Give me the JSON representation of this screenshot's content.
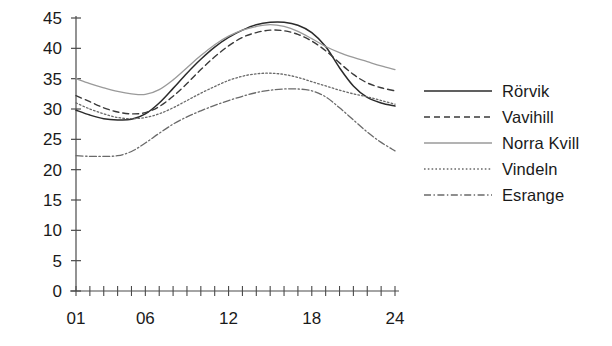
{
  "chart_data": {
    "type": "line",
    "title": "",
    "xlabel": "",
    "ylabel": "",
    "xlim": [
      1,
      24
    ],
    "ylim": [
      0,
      45
    ],
    "grid": false,
    "legend_position": "right",
    "x": [
      1,
      2,
      3,
      4,
      5,
      6,
      7,
      8,
      9,
      10,
      11,
      12,
      13,
      14,
      15,
      16,
      17,
      18,
      19,
      20,
      21,
      22,
      23,
      24
    ],
    "xtick_values": [
      1,
      6,
      12,
      18,
      24
    ],
    "xtick_labels": [
      "01",
      "06",
      "12",
      "18",
      "24"
    ],
    "ytick_values": [
      0,
      5,
      10,
      15,
      20,
      25,
      30,
      35,
      40,
      45
    ],
    "ytick_labels": [
      "0",
      "5",
      "10",
      "15",
      "20",
      "25",
      "30",
      "35",
      "40",
      "45"
    ],
    "series": [
      {
        "name": "Rörvik",
        "style": "solid",
        "color": "#2b2b2b",
        "width": 1.5,
        "values": [
          29.8,
          29.0,
          28.4,
          28.2,
          28.3,
          29.2,
          31.0,
          33.4,
          35.9,
          38.2,
          40.2,
          41.8,
          43.0,
          43.9,
          44.3,
          44.3,
          43.8,
          42.6,
          40.3,
          36.8,
          33.8,
          31.9,
          31.0,
          30.5
        ]
      },
      {
        "name": "Vavihill",
        "style": "dashed",
        "color": "#3a3a3a",
        "width": 1.4,
        "values": [
          32.2,
          31.2,
          30.2,
          29.5,
          29.2,
          29.4,
          30.4,
          32.1,
          34.2,
          36.5,
          38.6,
          40.4,
          41.8,
          42.6,
          43.0,
          42.9,
          42.3,
          41.2,
          39.6,
          37.6,
          35.7,
          34.3,
          33.5,
          33.0
        ]
      },
      {
        "name": "Norra Kvill",
        "style": "solid-light",
        "color": "#9a9a9a",
        "width": 1.3,
        "values": [
          35.0,
          34.2,
          33.5,
          32.9,
          32.5,
          32.4,
          33.2,
          34.8,
          36.8,
          38.8,
          40.6,
          42.0,
          43.0,
          43.6,
          43.9,
          43.6,
          42.8,
          41.6,
          40.3,
          39.3,
          38.5,
          37.8,
          37.1,
          36.5
        ]
      },
      {
        "name": "Vindeln",
        "style": "dotted",
        "color": "#6a6a6a",
        "width": 1.3,
        "values": [
          31.0,
          30.0,
          29.2,
          28.6,
          28.4,
          28.6,
          29.2,
          30.2,
          31.4,
          32.6,
          33.7,
          34.7,
          35.4,
          35.8,
          35.9,
          35.7,
          35.2,
          34.5,
          33.8,
          33.1,
          32.5,
          32.0,
          31.4,
          30.8
        ]
      },
      {
        "name": "Esrange",
        "style": "dashdot",
        "color": "#6a6a6a",
        "width": 1.3,
        "values": [
          22.3,
          22.2,
          22.2,
          22.3,
          23.0,
          24.4,
          26.0,
          27.5,
          28.7,
          29.7,
          30.6,
          31.4,
          32.1,
          32.7,
          33.1,
          33.3,
          33.3,
          33.0,
          32.0,
          30.2,
          28.2,
          26.2,
          24.5,
          23.1
        ]
      }
    ]
  },
  "legend": {
    "items": [
      {
        "label": "Rörvik"
      },
      {
        "label": "Vavihill"
      },
      {
        "label": "Norra Kvill"
      },
      {
        "label": "Vindeln"
      },
      {
        "label": "Esrange"
      }
    ]
  },
  "colors": {
    "axis": "#4a4a4a",
    "text": "#1a1a1a",
    "background": "#ffffff"
  }
}
